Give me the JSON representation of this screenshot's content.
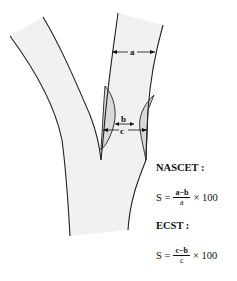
{
  "diagram": {
    "labels": {
      "a": "a",
      "b": "b",
      "c": "c"
    },
    "colors": {
      "vessel_fill": "#f1f1f1",
      "vessel_wall": "#222222",
      "plaque_fill": "#d9d9d9"
    }
  },
  "formulas": [
    {
      "method": "NASCET :",
      "lhs": "S =",
      "numerator": "a−b",
      "denominator": "a",
      "multiplier": "× 100"
    },
    {
      "method": "ECST :",
      "lhs": "S =",
      "numerator": "c−b",
      "denominator": "c",
      "multiplier": "× 100"
    }
  ]
}
